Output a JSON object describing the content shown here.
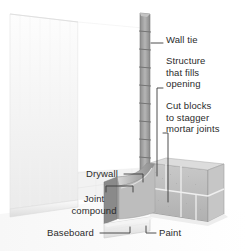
{
  "diagram": {
    "labels": [
      {
        "id": "wall-tie",
        "text": "Wall tie",
        "x": 166,
        "y": 39,
        "align": "left"
      },
      {
        "id": "structure-fills",
        "text": "Structure\nthat fills\nopening",
        "x": 166,
        "y": 57,
        "align": "left"
      },
      {
        "id": "cut-blocks",
        "text": "Cut blocks\nto stagger\nmortar joints",
        "x": 166,
        "y": 102,
        "align": "left"
      },
      {
        "id": "drywall",
        "text": "Drywall",
        "x": 86,
        "y": 168,
        "align": "left"
      },
      {
        "id": "joint-compound",
        "text": "Joint\ncompound",
        "x": 56,
        "y": 198,
        "align": "left"
      },
      {
        "id": "baseboard",
        "text": "Baseboard",
        "x": 52,
        "y": 228,
        "align": "left"
      },
      {
        "id": "paint",
        "text": "Paint",
        "x": 159,
        "y": 228,
        "align": "left"
      }
    ],
    "colors": {
      "background": "#ffffff",
      "drywall_face": "#f2f2f2",
      "drywall_shade": "#e3e3e3",
      "block_light": "#cfcfcf",
      "block_mid": "#b3b3b3",
      "block_dark": "#8f8f8f",
      "mortar": "#e8e8e8",
      "tie_column": "#9a9a9a",
      "leader_line": "#3a3a3a",
      "text": "#2b2b2b",
      "opening": "#ffffff"
    },
    "parts": [
      "left drywall wall surface",
      "white opening",
      "vertical wall tie column with ties",
      "concrete block infill wall",
      "curved drywall return / joint compound",
      "baseboard strip",
      "painted block face"
    ]
  }
}
